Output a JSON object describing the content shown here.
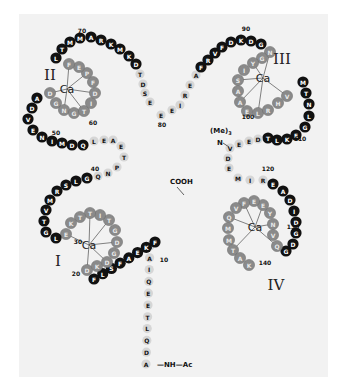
{
  "ion_label": "Ca",
  "domains": [
    {
      "label": "I",
      "center": [
        125,
        244
      ]
    },
    {
      "label": "II",
      "center": [
        67,
        89
      ]
    },
    {
      "label": "III",
      "center": [
        260,
        78
      ]
    },
    {
      "label": "IV",
      "center": [
        247,
        254
      ]
    }
  ],
  "terminals": {
    "n_term": "—NH—Ac",
    "c_term": "COOH",
    "methylation_prefix": "(Me)",
    "methylation_sub": "3",
    "methylation_n": "N"
  },
  "position_labels": [
    {
      "text": "10",
      "x": 164,
      "y": 262
    },
    {
      "text": "20",
      "x": 76,
      "y": 276
    },
    {
      "text": "30",
      "x": 78,
      "y": 244
    },
    {
      "text": "40",
      "x": 95,
      "y": 171
    },
    {
      "text": "50",
      "x": 56,
      "y": 135
    },
    {
      "text": "60",
      "x": 93,
      "y": 125
    },
    {
      "text": "70",
      "x": 82,
      "y": 33
    },
    {
      "text": "80",
      "x": 162,
      "y": 127
    },
    {
      "text": "90",
      "x": 246,
      "y": 31
    },
    {
      "text": "100",
      "x": 248,
      "y": 119
    },
    {
      "text": "110",
      "x": 300,
      "y": 141
    },
    {
      "text": "120",
      "x": 268,
      "y": 171
    },
    {
      "text": "130",
      "x": 293,
      "y": 229
    },
    {
      "text": "140",
      "x": 265,
      "y": 265
    }
  ],
  "residues": [
    {
      "n": 1,
      "aa": "A",
      "style": "light",
      "x": 146,
      "y": 364
    },
    {
      "n": 2,
      "aa": "D",
      "style": "light",
      "x": 149,
      "y": 352
    },
    {
      "n": 3,
      "aa": "Q",
      "style": "light",
      "x": 149,
      "y": 340
    },
    {
      "n": 4,
      "aa": "L",
      "style": "light",
      "x": 149,
      "y": 329
    },
    {
      "n": 5,
      "aa": "T",
      "style": "light",
      "x": 149,
      "y": 316
    },
    {
      "n": 6,
      "aa": "E",
      "style": "light",
      "x": 149,
      "y": 304
    },
    {
      "n": 7,
      "aa": "E",
      "style": "light",
      "x": 149,
      "y": 292
    },
    {
      "n": 8,
      "aa": "Q",
      "style": "light",
      "x": 149,
      "y": 280
    },
    {
      "n": 9,
      "aa": "I",
      "style": "light",
      "x": 149,
      "y": 269
    },
    {
      "n": 10,
      "aa": "A",
      "style": "light",
      "x": 150,
      "y": 258
    },
    {
      "n": 11,
      "aa": "E",
      "style": "light",
      "x": 150,
      "y": 247
    },
    {
      "n": 12,
      "aa": "F",
      "style": "dark",
      "x": 155,
      "y": 244
    },
    {
      "n": 13,
      "aa": "K",
      "style": "dark",
      "x": 146,
      "y": 250
    },
    {
      "n": 14,
      "aa": "E",
      "style": "dark",
      "x": 138,
      "y": 257
    },
    {
      "n": 15,
      "aa": "A",
      "style": "dark",
      "x": 131,
      "y": 264
    },
    {
      "n": 16,
      "aa": "F",
      "style": "dark",
      "x": 124,
      "y": 271
    },
    {
      "n": 17,
      "aa": "S",
      "style": "dark",
      "x": 115,
      "y": 276
    },
    {
      "n": 18,
      "aa": "L",
      "style": "dark",
      "x": 105,
      "y": 278
    },
    {
      "n": 19,
      "aa": "F",
      "style": "dark",
      "x": 94,
      "y": 279
    },
    {
      "n": 20,
      "aa": "D",
      "style": "grey",
      "x": 131,
      "y": 263
    },
    {
      "n": 21,
      "aa": "K",
      "style": "grey",
      "x": 0,
      "y": 0
    }
  ],
  "sequence_text": "ADQLTEEQIAEFKEAFSLFDKDGDGTITTKELGTVMRSLGQNPTEAELQDMINEVDADGNGTIDFPEFLTMMARKMKDTDSEEEIREAFRVFDKDGNGYISAAELRHVMTNLGEKLTDEEVDEMIREADIDGDGQVNYEEFVQMMTAK",
  "residue_count": 148
}
